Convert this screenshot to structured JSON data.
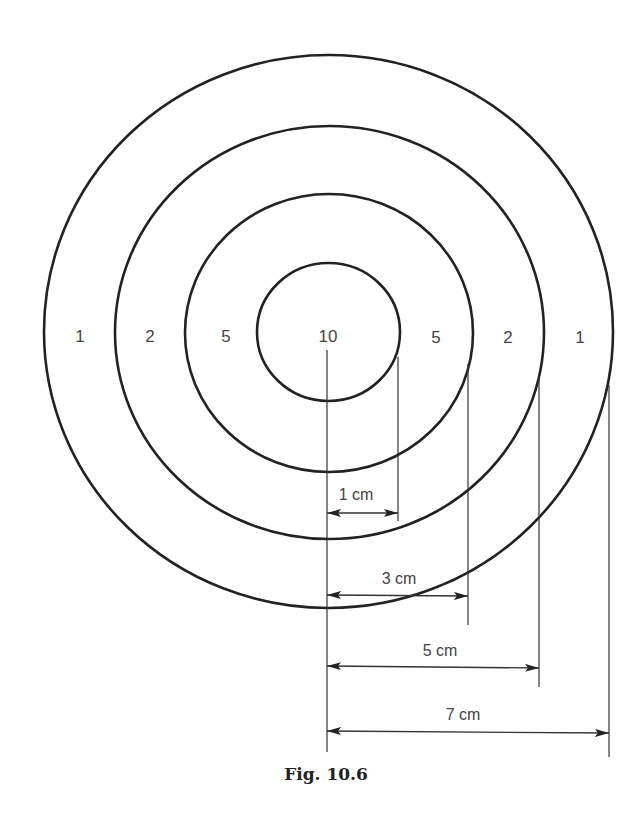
{
  "figure": {
    "caption": "Fig. 10.6",
    "colors": {
      "stroke": "#222222",
      "text": "#444444",
      "background": "#ffffff"
    },
    "rings": [
      {
        "name": "inner",
        "radius_cm": 1,
        "score": "10"
      },
      {
        "name": "second",
        "radius_cm": 3,
        "score": "5"
      },
      {
        "name": "third",
        "radius_cm": 5,
        "score": "2"
      },
      {
        "name": "outer",
        "radius_cm": 7,
        "score": "1"
      }
    ],
    "scores_left": [
      "1",
      "2",
      "5"
    ],
    "center_score": "10",
    "scores_right": [
      "5",
      "2",
      "1"
    ],
    "dimensions": [
      {
        "label": "1 cm"
      },
      {
        "label": "3 cm"
      },
      {
        "label": "5 cm"
      },
      {
        "label": "7 cm"
      }
    ]
  }
}
